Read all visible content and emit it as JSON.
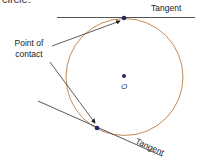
{
  "caption": "circle:",
  "labels": {
    "tangent_top": "Tangent",
    "point_of_contact_line1": "Point of",
    "point_of_contact_line2": "contact",
    "center": "O",
    "tangent_bottom": "Tangent"
  },
  "colors": {
    "circle": "#c58a55",
    "tangent": "#555555",
    "point": "#1f2a6b",
    "arrow": "#333333"
  }
}
